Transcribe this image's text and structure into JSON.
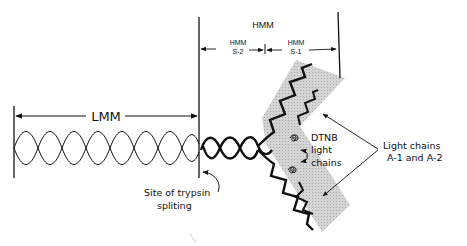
{
  "diagram": {
    "labels": {
      "hmm": "HMM",
      "hmm_s2_line1": "HMM",
      "hmm_s2_line2": "S-2",
      "hmm_s1_line1": "HMM",
      "hmm_s1_line2": "S-1",
      "lmm": "LMM",
      "trypsin_line1": "Site of trypsin",
      "trypsin_line2": "spliting",
      "dtnb_line1": "DTNB",
      "dtnb_line2": "light",
      "dtnb_line3": "chains",
      "light_chains_line1": "Light chains",
      "light_chains_line2": "A-1 and A-2"
    },
    "colors": {
      "ink": "#111111",
      "head_shading": "#c8c8c8",
      "background": "#ffffff"
    }
  }
}
